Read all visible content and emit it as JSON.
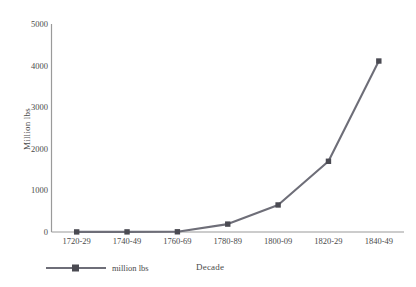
{
  "chart_data": {
    "type": "line",
    "title": "",
    "xlabel": "Decade",
    "ylabel": "Million lbs",
    "categories": [
      "1720-29",
      "1740-49",
      "1760-69",
      "1780-89",
      "1800-09",
      "1820-29",
      "1840-49"
    ],
    "series": [
      {
        "name": "million lbs",
        "values": [
          2,
          3,
          5,
          190,
          650,
          1700,
          4110
        ]
      }
    ],
    "ylim": [
      0,
      5000
    ],
    "yticks": [
      0,
      1000,
      2000,
      3000,
      4000,
      5000
    ],
    "ytick_labels": [
      "0",
      "1000",
      "2000",
      "3000",
      "4000",
      "5000"
    ],
    "grid": false,
    "legend_position": "bottom-left",
    "marker": "square",
    "line_color": "#6e6e78",
    "marker_color": "#4a4a52",
    "axis_color": "#9a9a9a"
  },
  "legend": {
    "entries": [
      {
        "label": "million lbs"
      }
    ]
  },
  "axes": {
    "x_title": "Decade",
    "y_title": "Million lbs"
  }
}
